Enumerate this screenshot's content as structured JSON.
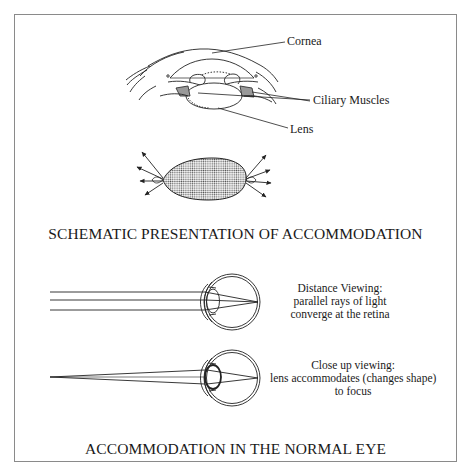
{
  "figure": {
    "top_section": {
      "labels": {
        "cornea": "Cornea",
        "ciliary_muscles": "Ciliary Muscles",
        "lens": "Lens"
      },
      "title": "SCHEMATIC PRESENTATION OF ACCOMMODATION"
    },
    "bottom_section": {
      "distance": {
        "line1": "Distance Viewing:",
        "line2": "parallel rays of light",
        "line3": "converge at the retina"
      },
      "close_up": {
        "line1": "Close up viewing:",
        "line2": "lens accommodates (changes shape)",
        "line3": "to focus"
      },
      "title": "ACCOMMODATION IN THE NORMAL EYE"
    },
    "colors": {
      "ink": "#1a1a1a",
      "frame": "#8a8a8a",
      "background": "#ffffff"
    }
  }
}
